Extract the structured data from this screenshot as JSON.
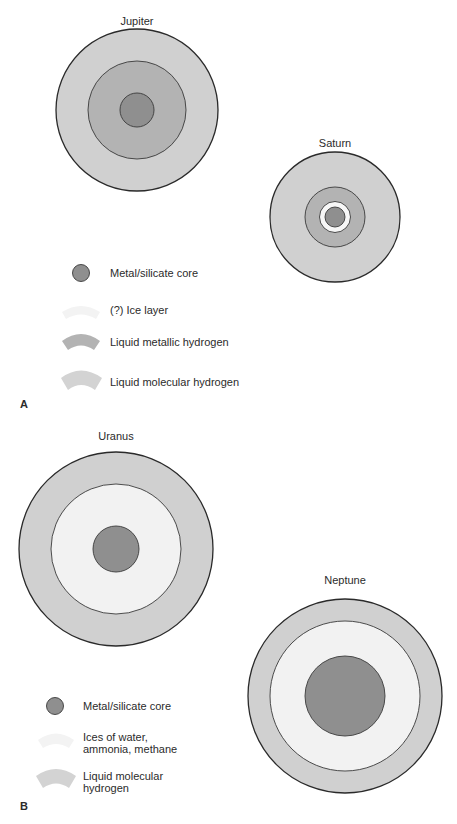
{
  "colors": {
    "core": "#8f8f8f",
    "metallic_hydrogen": "#b3b3b3",
    "molecular_hydrogen": "#d0d0d0",
    "ice": "#f2f2f2",
    "outline": "#2a2a2a"
  },
  "panel_a": {
    "letter": "A",
    "planets": [
      {
        "name": "Jupiter",
        "layers": [
          "Liquid molecular hydrogen",
          "Liquid metallic hydrogen",
          "Metal/silicate core"
        ]
      },
      {
        "name": "Saturn",
        "layers": [
          "Liquid molecular hydrogen",
          "Liquid metallic hydrogen",
          "(?) Ice layer",
          "Metal/silicate core"
        ]
      }
    ],
    "legend": [
      {
        "label": "Metal/silicate core"
      },
      {
        "label": "(?) Ice layer"
      },
      {
        "label": "Liquid metallic hydrogen"
      },
      {
        "label": "Liquid molecular hydrogen"
      }
    ]
  },
  "panel_b": {
    "letter": "B",
    "planets": [
      {
        "name": "Uranus",
        "layers": [
          "Liquid molecular hydrogen",
          "Ices of water, ammonia, methane",
          "Metal/silicate core"
        ]
      },
      {
        "name": "Neptune",
        "layers": [
          "Liquid molecular hydrogen",
          "Ices of water, ammonia, methane",
          "Metal/silicate core"
        ]
      }
    ],
    "legend": [
      {
        "label": "Metal/silicate core"
      },
      {
        "label_line1": "Ices of water,",
        "label_line2": "ammonia, methane"
      },
      {
        "label_line1": "Liquid molecular",
        "label_line2": "hydrogen"
      }
    ]
  }
}
